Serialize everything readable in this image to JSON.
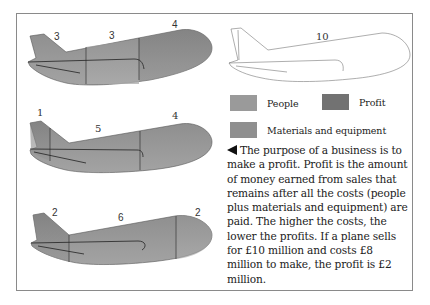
{
  "legend": {
    "people": {
      "label": "People",
      "color": "#9a9a9a"
    },
    "profit": {
      "label": "Profit",
      "color": "#727272"
    },
    "materials": {
      "label": "Materials and equipment",
      "color": "#8f8f8f"
    }
  },
  "planes": [
    {
      "segments": [
        {
          "label": "3",
          "kind": "people"
        },
        {
          "label": "3",
          "kind": "materials"
        },
        {
          "label": "4",
          "kind": "profit"
        }
      ]
    },
    {
      "segments": [
        {
          "label": "1",
          "kind": "profit"
        },
        {
          "label": "5",
          "kind": "materials"
        },
        {
          "label": "4",
          "kind": "people"
        }
      ]
    },
    {
      "segments": [
        {
          "label": "2",
          "kind": "profit"
        },
        {
          "label": "6",
          "kind": "materials"
        },
        {
          "label": "2",
          "kind": "people"
        }
      ]
    },
    {
      "total_label": "10"
    }
  ],
  "description": {
    "arrow_icon": "left-pointing-triangle",
    "text": "The purpose of a business is to make a profit. Profit is the amount of money earned from sales that remains after all the costs (people plus materials and equipment) are paid. The higher the costs, the lower the profits. If a plane sells for £10 million and costs £8 million to make, the profit is £2 million."
  }
}
